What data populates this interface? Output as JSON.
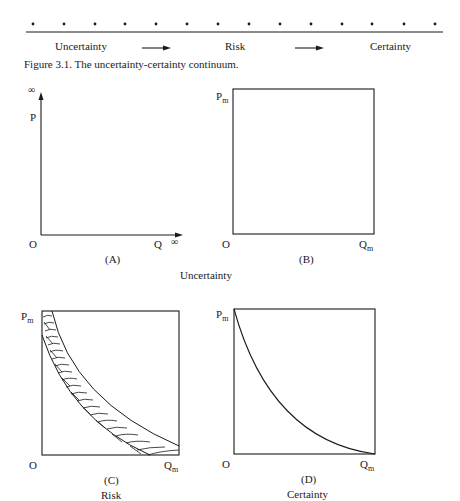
{
  "continuum": {
    "dot_count": 14,
    "labels": [
      "Uncertainty",
      "Risk",
      "Certainty"
    ],
    "arrow_icon": "right-arrow"
  },
  "caption": "Figure 3.1.  The uncertainty-certainty continuum.",
  "panels": [
    {
      "id": "A",
      "label": "(A)",
      "y_axis_label": "P",
      "y_axis_end": "∞",
      "x_axis_label": "Q",
      "x_axis_end": "∞",
      "origin": "O",
      "type": "open-axes"
    },
    {
      "id": "B",
      "label": "(B)",
      "y_max_label": "P",
      "y_max_sub": "m",
      "x_max_label": "Q",
      "x_max_sub": "m",
      "origin": "O",
      "type": "empty-box"
    },
    {
      "id": "C",
      "label": "(C)",
      "y_max_label": "P",
      "y_max_sub": "m",
      "x_max_label": "Q",
      "x_max_sub": "m",
      "origin": "O",
      "type": "hatched-band"
    },
    {
      "id": "D",
      "label": "(D)",
      "y_max_label": "P",
      "y_max_sub": "m",
      "x_max_label": "Q",
      "x_max_sub": "m",
      "origin": "O",
      "type": "single-curve"
    }
  ],
  "group_labels": {
    "uncertainty": "Uncertainty",
    "risk": "Risk",
    "certainty": "Certainty"
  },
  "colors": {
    "ink": "#1a1a1a",
    "background": "#ffffff"
  }
}
